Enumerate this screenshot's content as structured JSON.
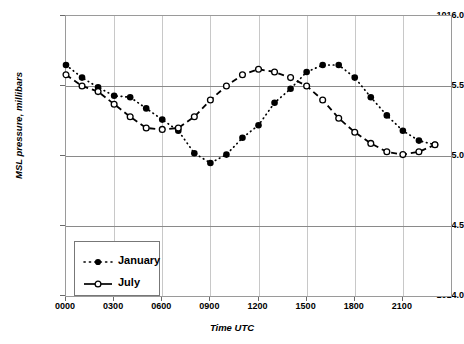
{
  "chart_data": {
    "type": "line",
    "title": "",
    "xlabel": "Time UTC",
    "ylabel": "MSL pressure, millibars",
    "ylim": [
      1014.0,
      1016.0
    ],
    "xlim": [
      0,
      24
    ],
    "grid": true,
    "legend_position": "lower-left",
    "y_ticks": [
      "1014.0",
      "1014.5",
      "1015.0",
      "1015.5",
      "1016.0"
    ],
    "y_tick_values": [
      1014.0,
      1014.5,
      1015.0,
      1015.5,
      1016.0
    ],
    "x_ticks": [
      "0000",
      "0300",
      "0600",
      "0900",
      "1200",
      "1500",
      "1800",
      "2100"
    ],
    "x_tick_values": [
      0,
      3,
      6,
      9,
      12,
      15,
      18,
      21
    ],
    "x": [
      0,
      1,
      2,
      3,
      4,
      5,
      6,
      7,
      8,
      9,
      10,
      11,
      12,
      13,
      14,
      15,
      16,
      17,
      18,
      19,
      20,
      21,
      22,
      23
    ],
    "series": [
      {
        "name": "January",
        "marker": "filled-circle",
        "line": "dotted",
        "values": [
          1015.65,
          1015.56,
          1015.49,
          1015.43,
          1015.42,
          1015.34,
          1015.26,
          1015.18,
          1015.02,
          1014.95,
          1015.01,
          1015.13,
          1015.22,
          1015.38,
          1015.48,
          1015.6,
          1015.65,
          1015.65,
          1015.56,
          1015.42,
          1015.29,
          1015.18,
          1015.11,
          1015.08
        ]
      },
      {
        "name": "July",
        "marker": "open-circle",
        "line": "dashed",
        "values": [
          1015.58,
          1015.5,
          1015.46,
          1015.37,
          1015.28,
          1015.2,
          1015.19,
          1015.2,
          1015.28,
          1015.4,
          1015.5,
          1015.58,
          1015.62,
          1015.6,
          1015.56,
          1015.5,
          1015.4,
          1015.27,
          1015.17,
          1015.09,
          1015.03,
          1015.01,
          1015.03,
          1015.08
        ]
      }
    ],
    "series_alt_note": ""
  },
  "legend": {
    "items": [
      {
        "label": "January"
      },
      {
        "label": "July"
      }
    ]
  },
  "colors": {
    "series": "#000000",
    "gridline_major": "#8a8a8a",
    "gridline_minor": "#c8c8c8",
    "frame": "#9a9a9a",
    "background": "#ffffff"
  },
  "caption": {
    "text": ""
  }
}
